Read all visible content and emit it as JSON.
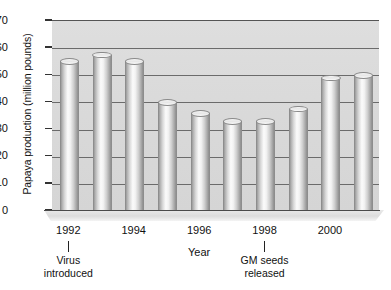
{
  "chart_data": {
    "type": "bar",
    "title": "",
    "xlabel": "Year",
    "ylabel": "Papaya production (million pounds)",
    "categories": [
      "1992",
      "1993",
      "1994",
      "1995",
      "1996",
      "1997",
      "1998",
      "1999",
      "2000",
      "2001"
    ],
    "values": [
      55,
      57.5,
      55,
      40,
      36,
      33,
      33,
      37.5,
      49,
      50
    ],
    "ylim": [
      0,
      70
    ],
    "ytick_values": [
      0,
      10,
      20,
      30,
      40,
      50,
      60,
      70
    ],
    "ytick_labels": [
      "0",
      "10",
      "20",
      "30",
      "40",
      "50",
      "60",
      "70"
    ],
    "xtick_labels": [
      "1992",
      "1994",
      "1996",
      "1998",
      "2000"
    ],
    "xtick_categories": [
      "1992",
      "1994",
      "1996",
      "1998",
      "2000"
    ],
    "grid": true,
    "legend": "none",
    "bar_style": "cylinder",
    "annotations": [
      {
        "text_line1": "Virus",
        "text_line2": "introduced",
        "category": "1992"
      },
      {
        "text_line1": "GM seeds",
        "text_line2": "released",
        "category": "1998"
      }
    ],
    "colors": {
      "plot_background": "#d9d9d9",
      "gridline": "#6b6b6b",
      "axis": "#333333",
      "bar_light": "#fbfbfb",
      "bar_dark": "#8e8e8e",
      "text": "#111111"
    }
  }
}
